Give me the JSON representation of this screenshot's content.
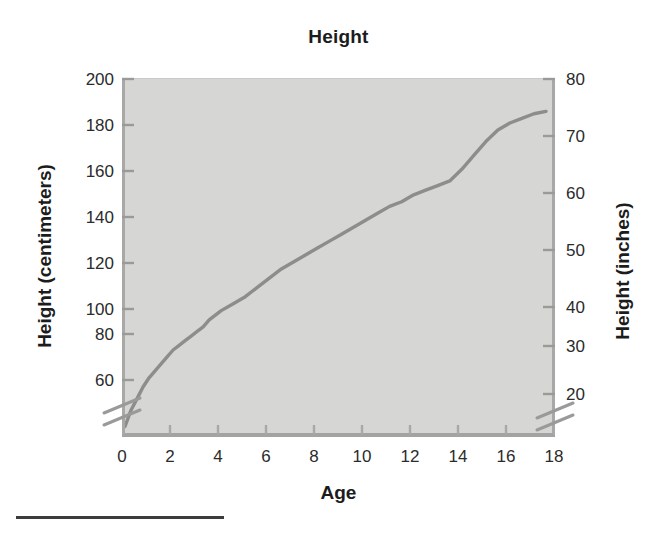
{
  "chart_data": {
    "type": "line",
    "title": "Height",
    "xlabel": "Age",
    "ylabel": "Height (centimeters)",
    "ylabel_secondary": "Height (inches)",
    "grid": false,
    "legend": "none",
    "xlim": [
      0,
      18
    ],
    "ylim": [
      45,
      200
    ],
    "ylim_secondary": [
      18,
      80
    ],
    "xticks": [
      0,
      2,
      4,
      6,
      8,
      10,
      12,
      14,
      16,
      18
    ],
    "xticklabels": [
      "0",
      "2",
      "4",
      "6",
      "8",
      "10",
      "12",
      "14",
      "16",
      "18"
    ],
    "yticks": [
      60,
      80,
      100,
      120,
      140,
      160,
      180,
      200
    ],
    "yticklabels": [
      "60",
      "80",
      "100",
      "120",
      "140",
      "160",
      "180",
      "200"
    ],
    "yticks_secondary": [
      20,
      30,
      40,
      50,
      60,
      70,
      80
    ],
    "yticklabels_secondary": [
      "20",
      "30",
      "40",
      "50",
      "60",
      "70",
      "80"
    ],
    "axis_break_left": true,
    "axis_break_right": true,
    "axis_break_note": "Both vertical axes are broken below 60 cm / 20 in",
    "series": [
      {
        "name": "Height",
        "color": "#8d8d8b",
        "x": [
          0,
          0.25,
          0.5,
          0.75,
          1,
          1.25,
          1.5,
          1.75,
          2,
          2.25,
          2.5,
          2.75,
          3,
          3.25,
          3.5,
          4,
          4.5,
          5,
          5.5,
          6,
          6.5,
          7,
          7.5,
          8,
          8.5,
          9,
          9.5,
          10,
          10.5,
          11,
          11.5,
          12,
          12.5,
          13,
          13.5,
          14,
          14.5,
          15,
          15.5,
          16,
          16.5,
          17,
          17.5
        ],
        "y": [
          50,
          57,
          62,
          67,
          71,
          74,
          77,
          80,
          83,
          85,
          87,
          89,
          91,
          93,
          96,
          100,
          103,
          106,
          110,
          114,
          118,
          121,
          124,
          127,
          130,
          133,
          136,
          139,
          142,
          145,
          147,
          150,
          152,
          154,
          156,
          161,
          167,
          173,
          178,
          181,
          183,
          185,
          186
        ],
        "units": "centimeters"
      }
    ]
  },
  "figure": {
    "title": "Height",
    "axis_titles": {
      "x": "Age",
      "y_left": "Height (centimeters)",
      "y_right": "Height (inches)"
    }
  }
}
